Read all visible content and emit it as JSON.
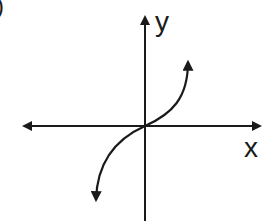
{
  "figure": {
    "partial_label": ")",
    "axes": {
      "x_label": "x",
      "y_label": "y"
    },
    "curve": {
      "description": "cubic-like increasing curve through origin with arrows at both ends",
      "passes_through_origin": true
    },
    "colors": {
      "stroke": "#1a1a1a",
      "background": "#ffffff"
    }
  }
}
